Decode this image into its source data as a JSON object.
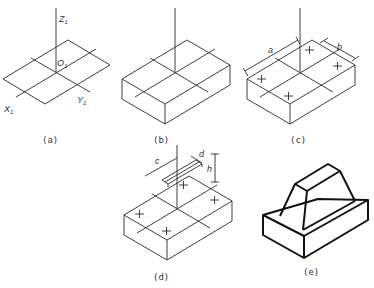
{
  "figure": {
    "panels": [
      {
        "id": "a",
        "caption": "(a)",
        "axis_labels": {
          "z": "Z",
          "origin": "O",
          "x": "X",
          "y": "Y",
          "subscript": "1"
        }
      },
      {
        "id": "b",
        "caption": "(b)"
      },
      {
        "id": "c",
        "caption": "(c)",
        "dimensions": [
          "a",
          "b"
        ]
      },
      {
        "id": "d",
        "caption": "(d)",
        "dimensions": [
          "c",
          "d",
          "h"
        ]
      },
      {
        "id": "e",
        "caption": "(e)"
      }
    ]
  }
}
